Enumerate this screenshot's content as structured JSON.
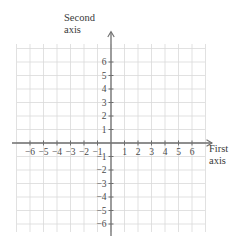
{
  "figure": {
    "type": "cartesian-coordinate-grid",
    "background_color": "#ffffff",
    "grid_color": "#d9d9d9",
    "axis_color": "#6e6e6e",
    "label_color": "#4a4a4a",
    "origin_label": "",
    "unit_px": 13.5,
    "origin_px": {
      "x": 111,
      "y": 143
    },
    "grid_extent_px": {
      "left": 17,
      "right": 205,
      "top": 44,
      "bottom": 232
    },
    "grid_extent_units": {
      "xmin": -7,
      "xmax": 7,
      "ymin": -7,
      "ymax": 7
    }
  },
  "axes": {
    "horizontal": {
      "name": "First axis",
      "label_lines": [
        "First",
        "axis"
      ],
      "arrowhead": "right",
      "tick_values": [
        -6,
        -5,
        -4,
        -3,
        -2,
        -1,
        1,
        2,
        3,
        4,
        5,
        6
      ],
      "tick_labels": [
        "−6",
        "−5",
        "−4",
        "−3",
        "−2",
        "−1",
        "1",
        "2",
        "3",
        "4",
        "5",
        "6"
      ],
      "range": [
        -7,
        7
      ]
    },
    "vertical": {
      "name": "Second axis",
      "label_lines": [
        "Second",
        "axis"
      ],
      "arrowhead": "up",
      "tick_values": [
        6,
        5,
        4,
        3,
        2,
        1,
        -1,
        -2,
        -3,
        -4,
        -5,
        -6
      ],
      "tick_labels": [
        "6",
        "5",
        "4",
        "3",
        "2",
        "1",
        "−1",
        "−2",
        "−3",
        "−4",
        "−5",
        "−6"
      ],
      "range": [
        -7,
        7
      ]
    }
  },
  "chart_data": {
    "type": "scatter",
    "title": "",
    "xlabel": "First axis",
    "ylabel": "Second axis",
    "xlim": [
      -7,
      7
    ],
    "ylim": [
      -7,
      7
    ],
    "xticks": [
      -6,
      -5,
      -4,
      -3,
      -2,
      -1,
      1,
      2,
      3,
      4,
      5,
      6
    ],
    "yticks": [
      -6,
      -5,
      -4,
      -3,
      -2,
      -1,
      1,
      2,
      3,
      4,
      5,
      6
    ],
    "grid": true,
    "legend": null,
    "series": [],
    "points": [],
    "annotations": []
  }
}
